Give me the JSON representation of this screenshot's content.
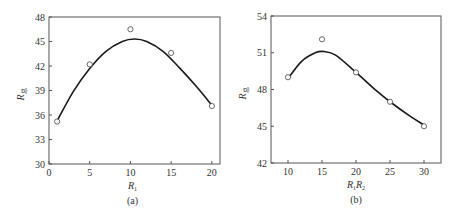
{
  "chart_data": [
    {
      "type": "scatter",
      "panel_label": "(a)",
      "title": "",
      "xlabel": "R1",
      "xlabel_main": "R",
      "xlabel_sub": "1",
      "ylabel": "R总",
      "ylabel_main": "R",
      "ylabel_sub": "总",
      "xlim": [
        0,
        21
      ],
      "ylim": [
        30,
        48
      ],
      "xticks": [
        0,
        5,
        10,
        15,
        20
      ],
      "yticks": [
        30,
        33,
        36,
        39,
        42,
        45,
        48
      ],
      "grid": false,
      "legend": null,
      "series": [
        {
          "name": "measured",
          "marker": "open-circle",
          "x": [
            1,
            5,
            10,
            15,
            20
          ],
          "y": [
            35.2,
            42.2,
            46.5,
            43.6,
            37.1
          ]
        },
        {
          "name": "fit",
          "style": "smooth-line",
          "x": [
            1,
            3,
            5,
            7,
            9,
            10.5,
            12,
            14,
            16,
            18,
            20
          ],
          "y": [
            35.3,
            38.9,
            41.7,
            43.8,
            45.0,
            45.3,
            45.0,
            43.8,
            41.8,
            39.6,
            37.2
          ]
        }
      ]
    },
    {
      "type": "scatter",
      "panel_label": "(b)",
      "title": "",
      "xlabel": "R1R2",
      "xlabel_main1": "R",
      "xlabel_sub1": "1",
      "xlabel_main2": "R",
      "xlabel_sub2": "2",
      "ylabel": "R总",
      "ylabel_main": "R",
      "ylabel_sub": "总",
      "xlim": [
        7.5,
        32.5
      ],
      "ylim": [
        42,
        54
      ],
      "xticks": [
        10,
        15,
        20,
        25,
        30
      ],
      "yticks": [
        42,
        45,
        48,
        51,
        54
      ],
      "grid": false,
      "legend": null,
      "series": [
        {
          "name": "measured",
          "marker": "open-circle",
          "x": [
            10,
            15,
            20,
            25,
            30
          ],
          "y": [
            49.0,
            52.1,
            49.4,
            47.0,
            45.0
          ]
        },
        {
          "name": "fit",
          "style": "smooth-line",
          "x": [
            10,
            12,
            14,
            15.3,
            17,
            20,
            23,
            25,
            28,
            30
          ],
          "y": [
            48.9,
            50.3,
            51.0,
            51.1,
            50.8,
            49.4,
            47.9,
            47.0,
            45.8,
            45.1
          ]
        }
      ]
    }
  ]
}
